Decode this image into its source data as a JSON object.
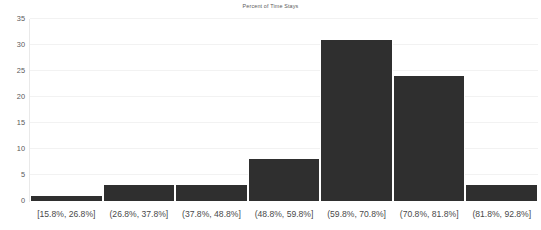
{
  "chart_data": {
    "type": "bar",
    "title": "Percent of Time Stays",
    "xlabel": "",
    "ylabel": "",
    "categories": [
      "[15.8%, 26.8%]",
      "(26.8%, 37.8%]",
      "(37.8%, 48.8%]",
      "(48.8%, 59.8%]",
      "(59.8%, 70.8%]",
      "(70.8%, 81.8%]",
      "(81.8%, 92.8%]"
    ],
    "values": [
      1,
      3,
      3,
      8,
      31,
      24,
      3
    ],
    "ylim": [
      0,
      35
    ],
    "yticks": [
      0,
      5,
      10,
      15,
      20,
      25,
      30,
      35
    ],
    "ytick_labels": [
      "0",
      "5",
      "10",
      "15",
      "20",
      "25",
      "30",
      "35"
    ],
    "grid": true,
    "legend": false,
    "bar_color": "#2f2f2f",
    "grid_color": "#f2f2f2",
    "text_color": "#595959"
  }
}
